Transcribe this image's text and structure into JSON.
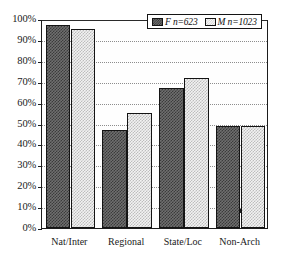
{
  "chart_data": {
    "type": "bar",
    "title": "",
    "subtitle": "",
    "xlabel": "",
    "ylabel": "",
    "categories": [
      "Nat/Inter",
      "Regional",
      "State/Loc",
      "Non-Arch"
    ],
    "series": [
      {
        "name": "F n=623",
        "key": "F",
        "values": [
          97,
          47,
          67,
          49
        ]
      },
      {
        "name": "M n=1023",
        "key": "M",
        "values": [
          95,
          55,
          72,
          49
        ]
      }
    ],
    "ylim": [
      0,
      100
    ],
    "ytick_values": [
      0,
      10,
      20,
      30,
      40,
      50,
      60,
      70,
      80,
      90,
      100
    ],
    "ytick_labels": [
      "0%",
      "10%",
      "20%",
      "30%",
      "40%",
      "50%",
      "60%",
      "70%",
      "80%",
      "90%",
      "100%"
    ],
    "grid": true,
    "grid_axis": "y",
    "grid_style": "dotted",
    "legend_position": "top-right",
    "legend_entries": [
      {
        "label": "F n=623",
        "swatch": "dark-checkerboard"
      },
      {
        "label": "M n=1023",
        "swatch": "light-checkerboard"
      }
    ],
    "colors": {
      "series_f_fill": "#6f6f6f",
      "series_f_pattern": "#3b3b3b",
      "series_m_fill": "#f2f2f2",
      "series_m_pattern": "#bdbdbd",
      "axis": "#1c1c1c",
      "gridline": "#8d8d8d",
      "background": "#ffffff",
      "text": "#1a1a1a"
    }
  }
}
